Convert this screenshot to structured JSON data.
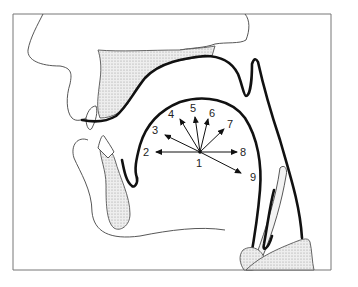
{
  "diagram": {
    "type": "sagittal-section-vocal-tract",
    "frame": {
      "stroke": "#777777",
      "background": "#ffffff"
    },
    "colors": {
      "outline": "#111111",
      "thin_line": "#444444",
      "shading": "#d9d9d9"
    },
    "center_label": "1",
    "arrows": [
      {
        "label": "2",
        "direction": "left"
      },
      {
        "label": "3",
        "direction": "upper-left"
      },
      {
        "label": "4",
        "direction": "up-left"
      },
      {
        "label": "5",
        "direction": "up"
      },
      {
        "label": "6",
        "direction": "up-right"
      },
      {
        "label": "7",
        "direction": "upper-right"
      },
      {
        "label": "8",
        "direction": "right"
      },
      {
        "label": "9",
        "direction": "lower-right"
      }
    ]
  }
}
